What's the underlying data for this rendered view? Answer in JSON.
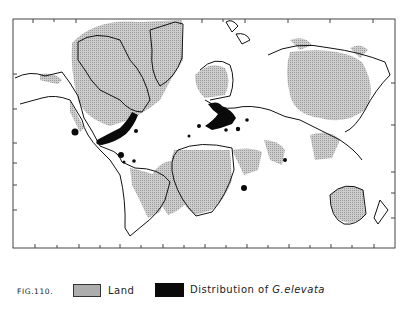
{
  "figure": {
    "label": "FIG.110.",
    "colors": {
      "land": "#c9c9c9",
      "distribution": "#0a0a0a",
      "outline": "#222222",
      "background": "#ffffff"
    }
  },
  "legend": {
    "items": [
      {
        "name": "land",
        "label": "Land"
      },
      {
        "name": "distribution",
        "label": "Distribution of",
        "species": "G.elevata"
      }
    ]
  },
  "map": {
    "frame": {
      "left": 13,
      "top": 19,
      "right": 395,
      "bottom": 248
    },
    "regions_land_shaded": [
      "North America (Canada)",
      "Greenland",
      "Scandinavia",
      "Siberia / Asia",
      "Africa",
      "South America",
      "Australia",
      "India",
      "Southeast Asia",
      "Arabia"
    ],
    "distribution_areas": [
      "Eastern United States",
      "Western Mexico",
      "Caribbean / Cuba",
      "Europe to Mediterranean",
      "North Africa coast",
      "Madagascar coast",
      "Sri Lanka",
      "Northern South America"
    ]
  }
}
